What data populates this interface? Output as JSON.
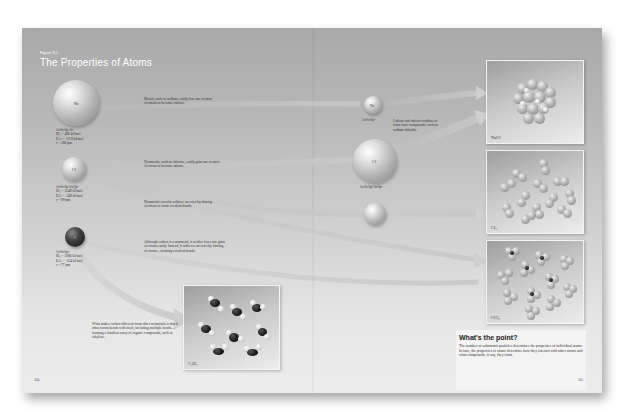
{
  "figure": {
    "label": "Figure 3.1",
    "title": "The Properties of Atoms"
  },
  "atoms": [
    {
      "symbol": "Na",
      "config": "1s²2s²2p⁶3s¹",
      "ie": "IE₁ = 496 kJ/mol",
      "ea": "EA = −52.9 kJ/mol",
      "radius": "r = 186 pm"
    },
    {
      "symbol": "Cl",
      "config": "1s²2s²2p⁶3s²3p⁵",
      "ie": "IE₁ = 1249 kJ/mol",
      "ea": "EA = −349 kJ/mol",
      "radius": "r = 99 pm"
    },
    {
      "symbol": "C",
      "config": "1s²2s²2p²",
      "ie": "IE₁ = 1086 kJ/mol",
      "ea": "EA = −154 kJ/mol",
      "radius": "r = 77 pm"
    }
  ],
  "ions": [
    {
      "symbol": "Na⁺",
      "config": "1s²2s²2p⁶"
    },
    {
      "symbol": "Cl⁻",
      "config": "1s²2s²2p⁶3s²3p⁶"
    }
  ],
  "captions": {
    "metals": "Metals, such as sodium, easily lose one or more electrons to become cations.",
    "nonmetals_gain": "Nonmetals, such as chlorine, easily gain one or more electrons to become anions.",
    "nonmetals_share": "Nonmetals can also achieve an octet by sharing electrons to form covalent bonds.",
    "carbon": "Although carbon is a nonmetal, it neither loses nor gains electrons easily. Instead, it achieves an octet by sharing electrons—forming covalent bonds.",
    "cations_anions": "Cations and anions combine to form ionic compounds, such as sodium chloride.",
    "carbon_diff": "What makes carbon different from other nonmetals is that it often forms bonds with itself, including multiple bonds—forming a limitless array of organic compounds, such as ethylene."
  },
  "panels": [
    {
      "label": "NaCl"
    },
    {
      "label": "Cl₂"
    },
    {
      "label": "CCl₄"
    },
    {
      "label": "C₂H₄"
    }
  ],
  "point": {
    "title": "What's the point?",
    "text": "The number of subatomic particles determines the properties of individual atoms. In turn, the properties of atoms determine how they interact with other atoms and what compounds, if any, they form."
  },
  "pages": {
    "left": "104",
    "right": "105"
  },
  "colors": {
    "background_top": "#a9a9a9",
    "background_bottom": "#ececec",
    "title": "#ffffff"
  }
}
